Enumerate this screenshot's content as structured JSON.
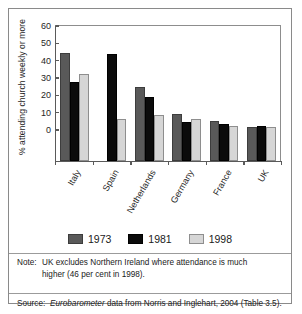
{
  "chart_data": {
    "type": "bar",
    "title": "",
    "xlabel": "",
    "ylabel": "% attending church weekly or more",
    "ylim": [
      0,
      60
    ],
    "yticks": [
      0,
      10,
      20,
      30,
      40,
      50,
      60
    ],
    "grid": false,
    "legend_position": "bottom-center",
    "categories": [
      "Italy",
      "Spain",
      "Netherlands",
      "Germany",
      "France",
      "UK"
    ],
    "series": [
      {
        "name": "1973",
        "color": "#595959",
        "values": [
          44,
          null,
          24,
          8.5,
          4.5,
          1
        ]
      },
      {
        "name": "1981",
        "color": "#0b0b0b",
        "values": [
          27,
          43,
          18.5,
          4,
          3,
          2
        ]
      },
      {
        "name": "1998",
        "color": "#d6d6d6",
        "values": [
          31.5,
          6,
          8,
          6,
          1.5,
          1
        ]
      }
    ]
  },
  "axis": {
    "y_label": "% attending church weekly or more",
    "tick_labels": [
      "60",
      "50",
      "40",
      "30",
      "20",
      "10",
      "0"
    ]
  },
  "legend": {
    "items": [
      {
        "label": "1973",
        "swatch": "s1973"
      },
      {
        "label": "1981",
        "swatch": "s1981"
      },
      {
        "label": "1998",
        "swatch": "s1998"
      }
    ]
  },
  "footnotes": {
    "note_label": "Note:",
    "note_line1": "UK excludes Northern Ireland where attendance is much",
    "note_line2": "higher (46 per cent in 1998).",
    "source_label": "Source:",
    "source_italic": "Eurobarometer",
    "source_rest": " data from Norris and Inglehart, 2004 (Table 3.5)."
  }
}
